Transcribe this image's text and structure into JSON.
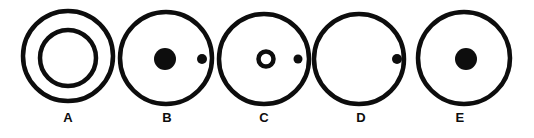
{
  "figure": {
    "background_color": "#ffffff",
    "stroke_color": "#0d0d0d",
    "fill_color": "#0d0d0d",
    "width": 534,
    "height": 138,
    "label_row_y": 122,
    "panels": [
      {
        "id": "A",
        "label": "A",
        "label_x": 68,
        "outer_circle": {
          "cx": 68,
          "cy": 56,
          "r": 45,
          "stroke_width": 4.5,
          "filled": false
        },
        "inner_circle": {
          "cx": 68,
          "cy": 58,
          "r": 28,
          "stroke_width": 4.5,
          "filled": false
        },
        "center_dot": null,
        "side_dot": null,
        "description": "Large outlined circle containing a smaller concentric outlined circle"
      },
      {
        "id": "B",
        "label": "B",
        "label_x": 167,
        "outer_circle": {
          "cx": 166,
          "cy": 58,
          "r": 46,
          "stroke_width": 4.5,
          "filled": false
        },
        "inner_circle": null,
        "center_dot": {
          "cx": 165,
          "cy": 59,
          "r": 11,
          "filled": true
        },
        "side_dot": {
          "cx": 202,
          "cy": 59,
          "r": 5,
          "filled": true
        },
        "description": "Large outlined circle with a large solid dot at center and a small solid dot near the right edge"
      },
      {
        "id": "C",
        "label": "C",
        "label_x": 264,
        "outer_circle": {
          "cx": 264,
          "cy": 59,
          "r": 45,
          "stroke_width": 4.5,
          "filled": false
        },
        "inner_circle": {
          "cx": 266,
          "cy": 59,
          "r": 7.5,
          "stroke_width": 4.5,
          "filled": false
        },
        "center_dot": null,
        "side_dot": {
          "cx": 298,
          "cy": 59,
          "r": 4.5,
          "filled": true
        },
        "description": "Large outlined circle with a small hollow circle at center and a small solid dot at the right edge"
      },
      {
        "id": "D",
        "label": "D",
        "label_x": 361,
        "outer_circle": {
          "cx": 359,
          "cy": 59,
          "r": 45,
          "stroke_width": 4.5,
          "filled": false
        },
        "inner_circle": null,
        "center_dot": null,
        "side_dot": {
          "cx": 397,
          "cy": 59,
          "r": 5,
          "filled": true
        },
        "description": "Large empty outlined circle with a small solid dot on the right edge"
      },
      {
        "id": "E",
        "label": "E",
        "label_x": 460,
        "outer_circle": {
          "cx": 464,
          "cy": 58,
          "r": 46,
          "stroke_width": 4.5,
          "filled": false
        },
        "inner_circle": null,
        "center_dot": {
          "cx": 466,
          "cy": 59,
          "r": 11,
          "filled": true
        },
        "side_dot": null,
        "description": "Large outlined circle with a large solid dot at center"
      }
    ]
  }
}
